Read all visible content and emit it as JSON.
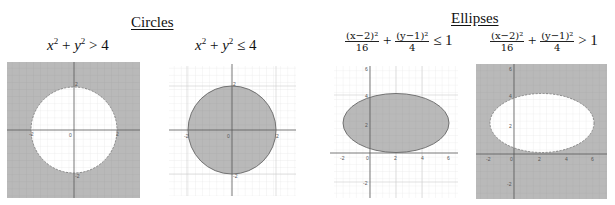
{
  "headings": {
    "circles": "Circles",
    "ellipses": "Ellipses"
  },
  "equations": {
    "circle_outside": {
      "lhs_x": "x",
      "exp": "2",
      "plus": " + ",
      "lhs_y": "y",
      "op": " > 4"
    },
    "circle_inside": {
      "lhs_x": "x",
      "exp": "2",
      "plus": " + ",
      "lhs_y": "y",
      "op": " ≤ 4"
    },
    "ellipse_inside": {
      "num1": "(x−2)²",
      "den1": "16",
      "plus": "+",
      "num2": "(y−1)²",
      "den2": "4",
      "op": "≤ 1"
    },
    "ellipse_outside": {
      "num1": "(x−2)²",
      "den1": "16",
      "plus": "+",
      "num2": "(y−1)²",
      "den2": "4",
      "op": "> 1"
    }
  },
  "panels": [
    {
      "name": "circle-outside-graph",
      "shape": "circle",
      "shaded": "outside",
      "boundary": "dashed",
      "labels": {
        "origin": "0",
        "top": "2",
        "bottom": "-2",
        "left": "-2",
        "right": "2"
      }
    },
    {
      "name": "circle-inside-graph",
      "shape": "circle",
      "shaded": "inside",
      "boundary": "solid",
      "labels": {
        "origin": "0",
        "top": "2",
        "bottom": "-2",
        "left": "-2",
        "right": "2"
      }
    },
    {
      "name": "ellipse-inside-graph",
      "shape": "ellipse",
      "shaded": "inside",
      "boundary": "solid",
      "labels": {
        "x": [
          "-2",
          "0",
          "2",
          "4",
          "6"
        ],
        "y": [
          "6",
          "4",
          "2",
          "-2"
        ]
      }
    },
    {
      "name": "ellipse-outside-graph",
      "shape": "ellipse",
      "shaded": "outside",
      "boundary": "dashed",
      "labels": {
        "x": [
          "-2",
          "0",
          "2",
          "4",
          "6"
        ],
        "y": [
          "6",
          "4",
          "2",
          "-2"
        ]
      }
    }
  ],
  "colors": {
    "shade": "#b9b9b9",
    "grid": "#a9a9a9",
    "light_grid": "#e4e4e4",
    "axis": "#555555"
  }
}
